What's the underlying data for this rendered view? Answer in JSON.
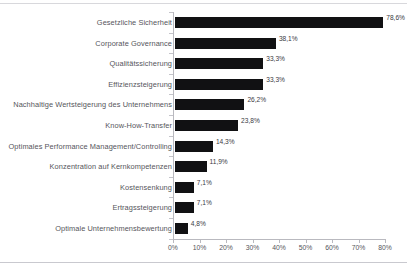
{
  "chart_data": {
    "type": "bar",
    "orientation": "horizontal",
    "title": "",
    "subtitle": "",
    "xlabel": "",
    "ylabel": "",
    "xlim": [
      0,
      80
    ],
    "xtick_step": 10,
    "grid": false,
    "legend": null,
    "bar_color": "#111113",
    "axis_color": "#b9b9bf",
    "text_color": "#55555b",
    "value_label_suffix": "%",
    "decimal_separator": ",",
    "categories": [
      "Gesetzliche Sicherheit",
      "Corporate Governance",
      "Qualitätssicherung",
      "Effizienzsteigerung",
      "Nachhaltige Wertsteigerung des Unternehmens",
      "Know-How-Transfer",
      "Optimales Performance Management/Controlling",
      "Konzentration auf Kernkompetenzen",
      "Kostensenkung",
      "Ertragssteigerung",
      "Optimale Unternehmensbewertung"
    ],
    "values": [
      78.6,
      38.1,
      33.3,
      33.3,
      26.2,
      23.8,
      14.3,
      11.9,
      7.1,
      7.1,
      4.8
    ],
    "value_labels": [
      "78,6%",
      "38,1%",
      "33,3%",
      "33,3%",
      "26,2%",
      "23,8%",
      "14,3%",
      "11,9%",
      "7,1%",
      "7,1%",
      "4,8%"
    ],
    "xticks": [
      0,
      10,
      20,
      30,
      40,
      50,
      60,
      70,
      80
    ],
    "xtick_labels": [
      "0%",
      "10%",
      "20%",
      "30%",
      "40%",
      "50%",
      "60%",
      "70%",
      "80%"
    ]
  }
}
